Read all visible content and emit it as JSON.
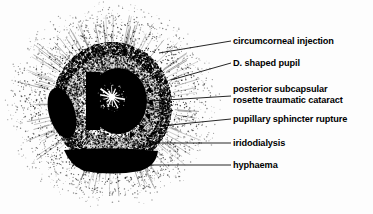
{
  "figure": {
    "type": "medical-illustration",
    "background_color": "#fdfdfd",
    "ink_color": "#000000"
  },
  "callouts": [
    {
      "id": "circumcorneal-injection",
      "text": "circumcorneal injection",
      "line2": "",
      "label_x": 233,
      "label_y": 36,
      "leader": {
        "x1": 231,
        "y1": 41,
        "x2": 159,
        "y2": 53
      }
    },
    {
      "id": "d-shaped-pupil",
      "text": "D. shaped pupil",
      "line2": "",
      "label_x": 233,
      "label_y": 58,
      "leader": {
        "x1": 231,
        "y1": 63,
        "x2": 171,
        "y2": 80
      }
    },
    {
      "id": "posterior-subcapsular-rosette-traumatic-cataract",
      "text": "posterior subcapsular",
      "line2": "rosette traumatic cataract",
      "label_x": 233,
      "label_y": 84,
      "leader": {
        "x1": 231,
        "y1": 96,
        "x2": 150,
        "y2": 101
      }
    },
    {
      "id": "pupillary-sphincter-rupture",
      "text": "pupillary sphincter rupture",
      "line2": "",
      "label_x": 233,
      "label_y": 114,
      "leader": {
        "x1": 231,
        "y1": 119,
        "x2": 160,
        "y2": 126
      }
    },
    {
      "id": "iridodialysis",
      "text": "iridodialysis",
      "line2": "",
      "label_x": 233,
      "label_y": 138,
      "leader": {
        "x1": 231,
        "y1": 143,
        "x2": 147,
        "y2": 143
      }
    },
    {
      "id": "hyphaema",
      "text": "hyphaema",
      "line2": "",
      "label_x": 233,
      "label_y": 160,
      "leader": {
        "x1": 231,
        "y1": 165,
        "x2": 141,
        "y2": 165
      }
    }
  ],
  "anatomy": {
    "iris": {
      "cx": 112,
      "cy": 105,
      "rx": 60,
      "ry": 63
    },
    "pupil": {
      "cx": 118,
      "cy": 101,
      "rx": 29,
      "ry": 33
    },
    "rosette": {
      "cx": 112,
      "cy": 97,
      "rays": 14,
      "r_outer": 13
    },
    "iridodialysis": {
      "cx": 62,
      "cy": 113,
      "rx": 13,
      "ry": 26,
      "rotate": -16
    },
    "hyphaema": {
      "cx": 111,
      "cy": 160,
      "rx": 48,
      "ry": 13
    },
    "injection_halo": {
      "cx": 112,
      "cy": 105,
      "r_inner": 62,
      "r_outer": 118
    }
  }
}
